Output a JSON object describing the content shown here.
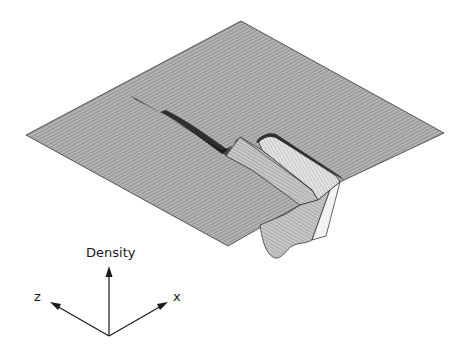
{
  "figure": {
    "type": "3d-surface-plot",
    "colors": {
      "surface_fill": "#9a9a9a",
      "surface_dark": "#2a2a2a",
      "surface_light": "#d8d8d8",
      "line": "#1a1a1a",
      "background": "#ffffff"
    }
  },
  "axes": {
    "vertical_label": "Density",
    "left_label": "z",
    "right_label": "x"
  }
}
